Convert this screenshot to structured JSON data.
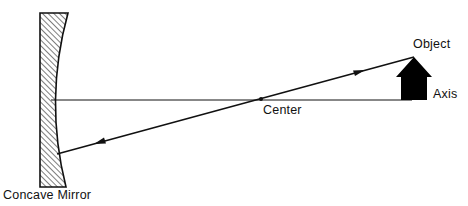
{
  "diagram": {
    "labels": {
      "object": "Object",
      "axis": "Axis",
      "center": "Center",
      "mirror": "Concave Mirror"
    },
    "elements": {
      "mirror": {
        "type": "concave-mirror",
        "hatched": true
      },
      "axis": {
        "type": "horizontal-line",
        "from": "mirror",
        "to": "object-base"
      },
      "object": {
        "type": "arrow-up",
        "fill": "#000000"
      },
      "ray": {
        "type": "line",
        "from": "object-tip",
        "through": "center",
        "to": "mirror",
        "arrows": [
          "toward-object",
          "toward-mirror"
        ]
      }
    },
    "colors": {
      "ink": "#111111",
      "background": "#ffffff"
    }
  }
}
